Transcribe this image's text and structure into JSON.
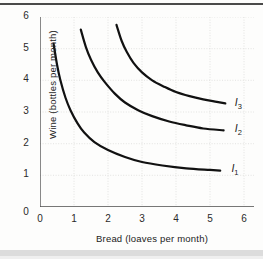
{
  "figure": {
    "xlabel": "Bread (loaves per month)",
    "ylabel": "Wine (bottles per month)"
  },
  "chart_data": {
    "type": "line",
    "title": "",
    "xlabel": "Bread (loaves per month)",
    "ylabel": "Wine (bottles per month)",
    "xlim": [
      0,
      6.4
    ],
    "ylim": [
      0,
      6.2
    ],
    "xticks": [
      0,
      1,
      2,
      3,
      4,
      5,
      6
    ],
    "yticks": [
      0,
      1,
      2,
      3,
      4,
      5,
      6
    ],
    "xtick_labels": [
      "0",
      "1",
      "2",
      "3",
      "4",
      "5",
      "6"
    ],
    "ytick_labels": [
      "0",
      "1",
      "2",
      "3",
      "4",
      "5",
      "6"
    ],
    "grid": true,
    "grid_style": "faint dotted",
    "legend": "inline end-of-curve labels",
    "line_color": "#111111",
    "line_width": 2.2,
    "series": [
      {
        "name": "I1",
        "label": "I",
        "label_sub": "1",
        "label_x": 5.6,
        "label_y": 1.2,
        "points": [
          [
            0.4,
            5.15
          ],
          [
            0.5,
            4.5
          ],
          [
            0.6,
            4.0
          ],
          [
            0.75,
            3.45
          ],
          [
            0.9,
            3.05
          ],
          [
            1.1,
            2.65
          ],
          [
            1.3,
            2.35
          ],
          [
            1.6,
            2.05
          ],
          [
            2.0,
            1.8
          ],
          [
            2.5,
            1.58
          ],
          [
            3.0,
            1.42
          ],
          [
            3.6,
            1.31
          ],
          [
            4.3,
            1.22
          ],
          [
            5.0,
            1.17
          ],
          [
            5.3,
            1.15
          ]
        ]
      },
      {
        "name": "I2",
        "label": "I",
        "label_sub": "2",
        "label_x": 5.7,
        "label_y": 2.45,
        "points": [
          [
            1.2,
            5.6
          ],
          [
            1.35,
            5.05
          ],
          [
            1.5,
            4.65
          ],
          [
            1.7,
            4.25
          ],
          [
            1.9,
            3.95
          ],
          [
            2.2,
            3.58
          ],
          [
            2.5,
            3.3
          ],
          [
            2.9,
            3.05
          ],
          [
            3.3,
            2.87
          ],
          [
            3.8,
            2.7
          ],
          [
            4.3,
            2.58
          ],
          [
            4.8,
            2.48
          ],
          [
            5.4,
            2.42
          ]
        ]
      },
      {
        "name": "I3",
        "label": "I",
        "label_sub": "3",
        "label_x": 5.7,
        "label_y": 3.28,
        "points": [
          [
            2.25,
            5.75
          ],
          [
            2.4,
            5.25
          ],
          [
            2.55,
            4.9
          ],
          [
            2.75,
            4.55
          ],
          [
            3.0,
            4.25
          ],
          [
            3.3,
            4.0
          ],
          [
            3.65,
            3.8
          ],
          [
            4.0,
            3.63
          ],
          [
            4.4,
            3.5
          ],
          [
            4.8,
            3.4
          ],
          [
            5.2,
            3.32
          ],
          [
            5.45,
            3.27
          ]
        ]
      }
    ]
  }
}
